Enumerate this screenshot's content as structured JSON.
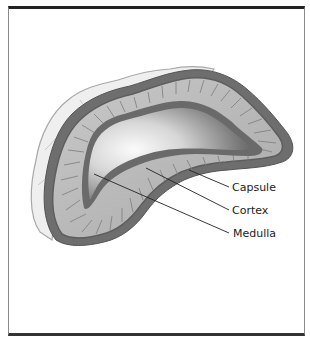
{
  "figure": {
    "labels": [
      {
        "id": "capsule",
        "text": "Capsule"
      },
      {
        "id": "cortex",
        "text": "Cortex"
      },
      {
        "id": "medulla",
        "text": "Medulla"
      }
    ]
  },
  "colors": {
    "frame_top": "#222222",
    "frame_side": "#8a8a8a",
    "fat_layer": "#ececec",
    "capsule": "#6e6e6e",
    "cortex": "#b9b9b9",
    "cortex_stripes": "#7a7a7a",
    "medulla_border": "#6a6a6a",
    "medulla_light": "#f4f4f4",
    "medulla_dark": "#4a4a4a",
    "leader_line": "#222222"
  }
}
